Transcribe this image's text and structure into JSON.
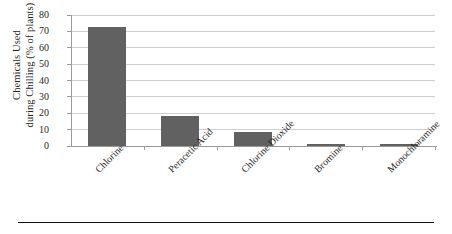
{
  "chart_data": {
    "type": "bar",
    "title": "",
    "xlabel": "",
    "ylabel_line1": "Chemicals Used",
    "ylabel_line2": "during Chilling (% of plants)",
    "categories": [
      "Chlorine",
      "Peracetic Acid",
      "Chlorine Dioxide",
      "Bromine",
      "Monochloramine"
    ],
    "values": [
      72.5,
      18.5,
      8.5,
      1.5,
      1.2
    ],
    "ylim": [
      0,
      80
    ],
    "ytick_labels": [
      "0",
      "10",
      "20",
      "30",
      "40",
      "50",
      "60",
      "70",
      "80"
    ],
    "ytick_values": [
      0,
      10,
      20,
      30,
      40,
      50,
      60,
      70,
      80
    ],
    "grid": true,
    "legend": "none",
    "bar_color": "#616161",
    "gridline_color": "#cfcfcf",
    "axis_color": "#9a9a9a",
    "text_color": "#1f1f1f"
  },
  "figure": {
    "bottom_rule_color": "#111111"
  }
}
